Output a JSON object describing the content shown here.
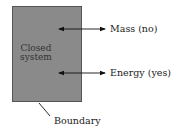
{
  "diagram": {
    "system_label_line1": "Closed",
    "system_label_line2": "system",
    "arrows": [
      {
        "label": "Mass (no)"
      },
      {
        "label": "Energy (yes)"
      }
    ],
    "boundary_label": "Boundary",
    "colors": {
      "system_fill": "#8a8a8a",
      "line": "#111111"
    }
  }
}
